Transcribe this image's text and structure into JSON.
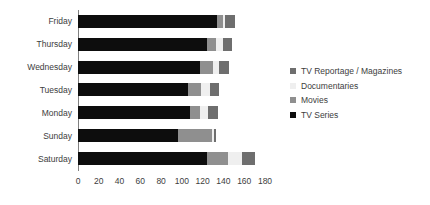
{
  "chart_data": {
    "type": "bar",
    "orientation": "horizontal",
    "stacked": true,
    "title": "",
    "xlabel": "",
    "ylabel": "",
    "xlim": [
      0,
      180
    ],
    "xticks": [
      0,
      20,
      40,
      60,
      80,
      100,
      120,
      140,
      160,
      180
    ],
    "grid": false,
    "legend_position": "right",
    "categories": [
      "Friday",
      "Thursday",
      "Wednesday",
      "Tuesday",
      "Monday",
      "Sunday",
      "Saturday"
    ],
    "series": [
      {
        "name": "TV Series",
        "color": "#0d0d0d",
        "values": [
          134,
          124,
          117,
          106,
          108,
          96,
          124
        ]
      },
      {
        "name": "Movies",
        "color": "#8f8f8f",
        "values": [
          6,
          9,
          13,
          12,
          9,
          33,
          20
        ]
      },
      {
        "name": "Documentaries",
        "color": "#efefef",
        "values": [
          2,
          7,
          6,
          9,
          8,
          2,
          14
        ]
      },
      {
        "name": "TV Reportage / Magazines",
        "color": "#6e6e6e",
        "values": [
          9,
          8,
          9,
          9,
          10,
          2,
          12
        ]
      }
    ],
    "totals": [
      151,
      148,
      145,
      136,
      135,
      133,
      170
    ]
  },
  "legend": {
    "items": [
      {
        "label": "TV Reportage / Magazines",
        "color": "#6e6e6e"
      },
      {
        "label": "Documentaries",
        "color": "#efefef"
      },
      {
        "label": "Movies",
        "color": "#8f8f8f"
      },
      {
        "label": "TV Series",
        "color": "#0d0d0d"
      }
    ]
  },
  "axis": {
    "x_tick_labels": [
      "0",
      "20",
      "40",
      "60",
      "80",
      "100",
      "120",
      "140",
      "160",
      "180"
    ]
  }
}
